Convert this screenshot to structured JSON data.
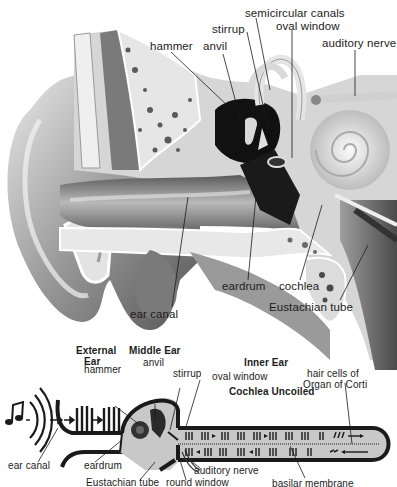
{
  "anatomy": {
    "title": "Cross-section of the human ear",
    "labels": {
      "hammer": "hammer",
      "anvil": "anvil",
      "stirrup": "stirrup",
      "semicircular_canals": "semicircular canals",
      "oval_window": "oval window",
      "auditory_nerve": "auditory nerve",
      "ear_canal": "ear canal",
      "eardrum": "eardrum",
      "cochlea": "cochlea",
      "eustachian_tube": "Eustachian tube"
    }
  },
  "schematic": {
    "title": "Sound transmission through the ear",
    "sections": {
      "external_ear": [
        "External",
        "Ear"
      ],
      "middle_ear": "Middle Ear",
      "inner_ear": "Inner Ear",
      "cochlea_uncoiled": "Cochlea Uncoiled"
    },
    "labels": {
      "hammer": "hammer",
      "anvil": "anvil",
      "stirrup": "stirrup",
      "oval_window": "oval window",
      "hair_cells": [
        "hair cells of",
        "Organ of Corti"
      ],
      "ear_canal": "ear canal",
      "eardrum": "eardrum",
      "eustachian_tube": "Eustachian tube",
      "round_window": "round window",
      "auditory_nerve": "auditory nerve",
      "basilar_membrane": "basilar membrane"
    },
    "colors": {
      "ink": "#1a1a1a",
      "fill": "#c8c8c8",
      "paper": "#ffffff"
    }
  }
}
